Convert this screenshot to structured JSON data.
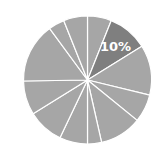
{
  "chart_data": {
    "type": "pie",
    "title": "",
    "start_angle_deg": 0,
    "direction": "clockwise",
    "categories": [
      "S1",
      "S2",
      "S3",
      "S4",
      "S5",
      "S6",
      "S7",
      "S8",
      "S9",
      "S10",
      "S11",
      "S12"
    ],
    "values": [
      6,
      10,
      12.5,
      7,
      10.5,
      3.5,
      7,
      9,
      8.5,
      15,
      4,
      6
    ],
    "labels": [
      "",
      "10%",
      "",
      "",
      "",
      "",
      "",
      "",
      "",
      "",
      "",
      ""
    ],
    "highlight_index": 1,
    "legend": "none"
  },
  "style": {
    "base_color": "#a6a6a6",
    "highlight_color": "#7f7f7f",
    "separator_color": "#ffffff",
    "label_color": "#ffffff",
    "center": [
      87.5,
      80
    ],
    "radius": 64
  }
}
